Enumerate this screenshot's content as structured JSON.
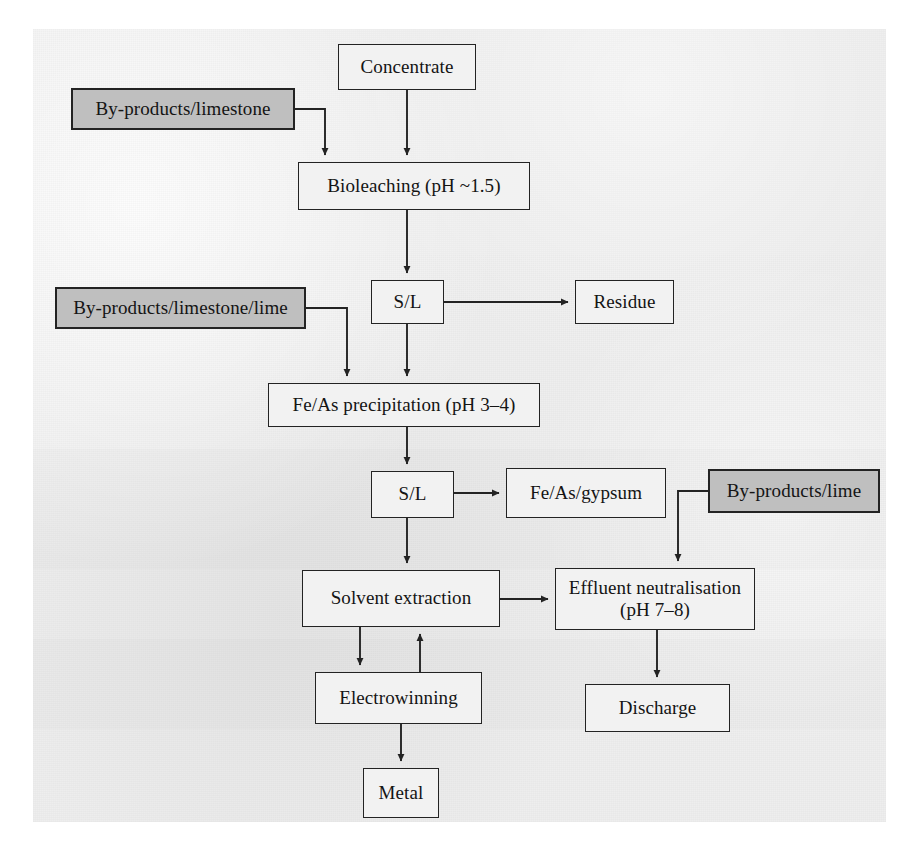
{
  "figure": {
    "type": "process-flow-diagram",
    "panel_background": "#eeeeee",
    "page_background": "#ffffff",
    "node_fill_plain": "#f2f2f2",
    "node_fill_shaded": "#bfbfbf",
    "line_color": "#232323"
  },
  "nodes": {
    "concentrate": {
      "label": "Concentrate",
      "style": "plain",
      "x": 338,
      "y": 44,
      "w": 138,
      "h": 46
    },
    "byproducts_limestone": {
      "label": "By-products/limestone",
      "style": "shaded",
      "x": 71,
      "y": 88,
      "w": 224,
      "h": 42
    },
    "bioleaching": {
      "label": "Bioleaching (pH ~1.5)",
      "style": "plain",
      "x": 298,
      "y": 162,
      "w": 232,
      "h": 48
    },
    "byproducts_lime_stone_lime": {
      "label": "By-products/limestone/lime",
      "style": "shaded",
      "x": 55,
      "y": 287,
      "w": 251,
      "h": 42
    },
    "sl_1": {
      "label": "S/L",
      "style": "plain",
      "x": 371,
      "y": 280,
      "w": 73,
      "h": 44
    },
    "residue": {
      "label": "Residue",
      "style": "plain",
      "x": 575,
      "y": 280,
      "w": 99,
      "h": 44
    },
    "feas_precipitation": {
      "label": "Fe/As precipitation (pH 3–4)",
      "style": "plain",
      "x": 268,
      "y": 383,
      "w": 272,
      "h": 44
    },
    "sl_2": {
      "label": "S/L",
      "style": "plain",
      "x": 371,
      "y": 471,
      "w": 83,
      "h": 47
    },
    "feas_gypsum": {
      "label": "Fe/As/gypsum",
      "style": "plain",
      "x": 506,
      "y": 468,
      "w": 160,
      "h": 50
    },
    "byproducts_lime": {
      "label": "By-products/lime",
      "style": "shaded",
      "x": 708,
      "y": 469,
      "w": 172,
      "h": 44
    },
    "solvent_extraction": {
      "label": "Solvent extraction",
      "style": "plain",
      "x": 302,
      "y": 570,
      "w": 198,
      "h": 57
    },
    "effluent_neutralisation": {
      "label": "Effluent neutralisation\n(pH 7–8)",
      "style": "plain",
      "x": 555,
      "y": 568,
      "w": 200,
      "h": 62
    },
    "electrowinning": {
      "label": "Electrowinning",
      "style": "plain",
      "x": 315,
      "y": 672,
      "w": 167,
      "h": 52
    },
    "discharge": {
      "label": "Discharge",
      "style": "plain",
      "x": 585,
      "y": 684,
      "w": 145,
      "h": 48
    },
    "metal": {
      "label": "Metal",
      "style": "plain",
      "x": 363,
      "y": 768,
      "w": 76,
      "h": 50
    }
  },
  "node_order": [
    "concentrate",
    "byproducts_limestone",
    "bioleaching",
    "byproducts_lime_stone_lime",
    "sl_1",
    "residue",
    "feas_precipitation",
    "sl_2",
    "feas_gypsum",
    "byproducts_lime",
    "solvent_extraction",
    "effluent_neutralisation",
    "electrowinning",
    "discharge",
    "metal"
  ],
  "edges": [
    {
      "name": "concentrate-to-bioleaching",
      "from": "concentrate",
      "to": "bioleaching",
      "path": "M 407,90 L 407,155",
      "arrow": true
    },
    {
      "name": "byproducts-limestone-to-bioleaching",
      "from": "byproducts_limestone",
      "to": "bioleaching",
      "path": "M 295,109 L 325,109 L 325,155",
      "arrow": true
    },
    {
      "name": "bioleaching-to-sl1",
      "from": "bioleaching",
      "to": "sl_1",
      "path": "M 407,210 L 407,273",
      "arrow": true
    },
    {
      "name": "sl1-to-residue",
      "from": "sl_1",
      "to": "residue",
      "path": "M 444,302 L 568,302",
      "arrow": true
    },
    {
      "name": "sl1-to-feas-precipitation",
      "from": "sl_1",
      "to": "feas_precipitation",
      "path": "M 407,324 L 407,376",
      "arrow": true
    },
    {
      "name": "byproducts-limestone-lime-to-feas",
      "from": "byproducts_lime_stone_lime",
      "to": "feas_precipitation",
      "path": "M 306,308 L 347,308 L 347,376",
      "arrow": true
    },
    {
      "name": "feas-precipitation-to-sl2",
      "from": "feas_precipitation",
      "to": "sl_2",
      "path": "M 407,427 L 407,464",
      "arrow": true
    },
    {
      "name": "sl2-to-feas-gypsum",
      "from": "sl_2",
      "to": "feas_gypsum",
      "path": "M 454,493 L 499,493",
      "arrow": true
    },
    {
      "name": "sl2-to-solvent-extraction",
      "from": "sl_2",
      "to": "solvent_extraction",
      "path": "M 407,518 L 407,563",
      "arrow": true
    },
    {
      "name": "byproducts-lime-to-effluent",
      "from": "byproducts_lime",
      "to": "effluent_neutralisation",
      "path": "M 708,491 L 678,491 L 678,561",
      "arrow": true
    },
    {
      "name": "solvent-extraction-to-effluent",
      "from": "solvent_extraction",
      "to": "effluent_neutralisation",
      "path": "M 500,599 L 548,599",
      "arrow": true
    },
    {
      "name": "solvent-extraction-to-electrowinning",
      "from": "solvent_extraction",
      "to": "electrowinning",
      "path": "M 360,627 L 360,665",
      "arrow": true
    },
    {
      "name": "electrowinning-to-solvent-extraction",
      "from": "electrowinning",
      "to": "solvent_extraction",
      "path": "M 420,672 L 420,634",
      "arrow": true
    },
    {
      "name": "electrowinning-to-metal",
      "from": "electrowinning",
      "to": "metal",
      "path": "M 401,724 L 401,761",
      "arrow": true
    },
    {
      "name": "effluent-to-discharge",
      "from": "effluent_neutralisation",
      "to": "discharge",
      "path": "M 657,630 L 657,677",
      "arrow": true
    }
  ]
}
